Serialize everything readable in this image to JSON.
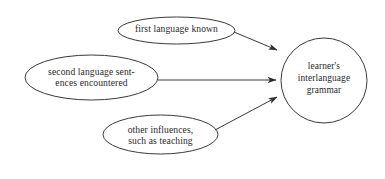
{
  "diagram": {
    "background_color": "#ffffff",
    "stroke_color": "#3a3a3a",
    "text_color": "#2b2b2b",
    "nodes": [
      {
        "id": "first-language",
        "shape": "ellipse",
        "label": "first language known",
        "cx": 176.5,
        "cy": 30.5,
        "rx": 58.5,
        "ry": 13.5
      },
      {
        "id": "second-language",
        "shape": "ellipse",
        "label": "second language sent-\nences encountered",
        "cx": 91.5,
        "cy": 77.5,
        "rx": 66.5,
        "ry": 22.5
      },
      {
        "id": "other-influences",
        "shape": "ellipse",
        "label": "other influences,\nsuch as teaching",
        "cx": 160.5,
        "cy": 134.5,
        "rx": 57.5,
        "ry": 19.5
      },
      {
        "id": "interlanguage-grammar",
        "shape": "circle",
        "label": "learner's\ninterlanguage\ngrammar",
        "cx": 324,
        "cy": 80.5,
        "rx": 43,
        "ry": 42.5
      }
    ],
    "arrows": [
      {
        "id": "arrow-first-language-to-grammar",
        "from": "first-language",
        "to": "interlanguage-grammar",
        "x1": 234,
        "y1": 32,
        "x2": 277,
        "y2": 50
      },
      {
        "id": "arrow-second-language-to-grammar",
        "from": "second-language",
        "to": "interlanguage-grammar",
        "x1": 158,
        "y1": 80,
        "x2": 276,
        "y2": 80
      },
      {
        "id": "arrow-other-influences-to-grammar",
        "from": "other-influences",
        "to": "interlanguage-grammar",
        "x1": 215,
        "y1": 130,
        "x2": 277,
        "y2": 97
      }
    ]
  }
}
